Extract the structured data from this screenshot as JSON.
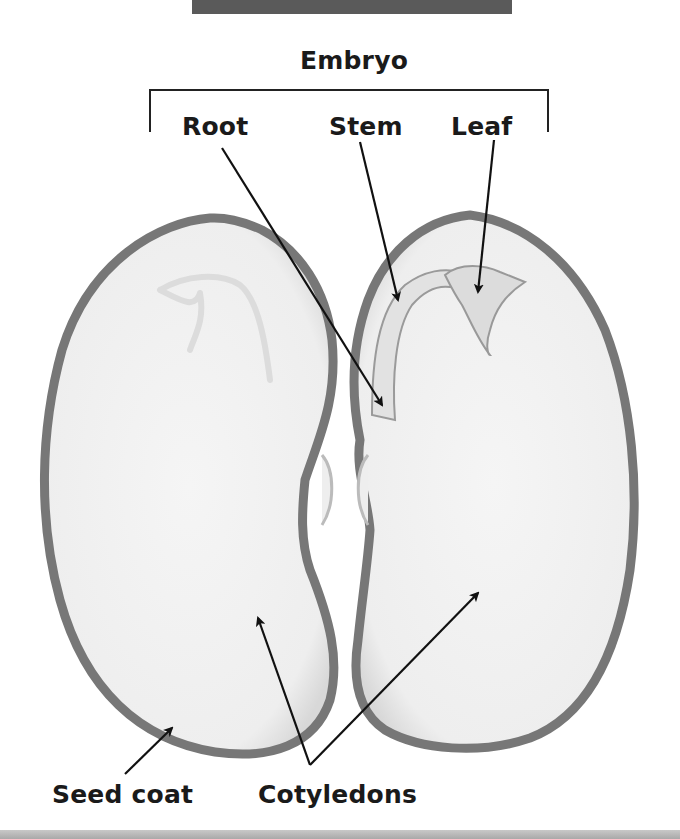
{
  "figure": {
    "title_bar_color": "#5a5a5a",
    "group_label": "Embryo",
    "labels": {
      "root": "Root",
      "stem": "Stem",
      "leaf": "Leaf",
      "seed_coat": "Seed coat",
      "cotyledons": "Cotyledons"
    },
    "colors": {
      "seed_coat": "#7a7a7a",
      "cotyledon_fill": "#f2f2f2",
      "embryo_fill": "#e4e4e4",
      "label_text": "#1a1a1a",
      "arrow": "#111111"
    }
  }
}
